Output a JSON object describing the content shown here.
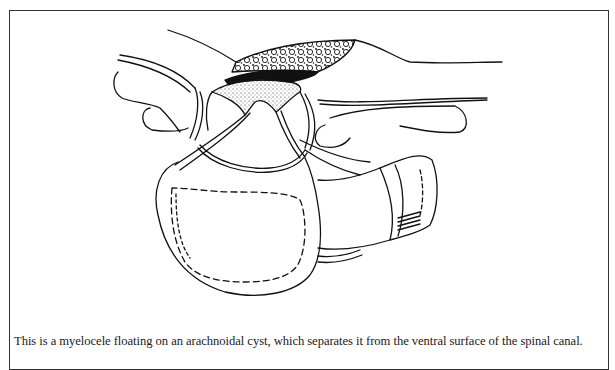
{
  "figure": {
    "type": "line-art medical illustration",
    "border_color": "#333333",
    "ink_color": "#111111"
  },
  "caption": {
    "text": "This is a myelocele floating on an arachnoidal cyst, which separates it from the ventral surface of the spinal canal."
  }
}
